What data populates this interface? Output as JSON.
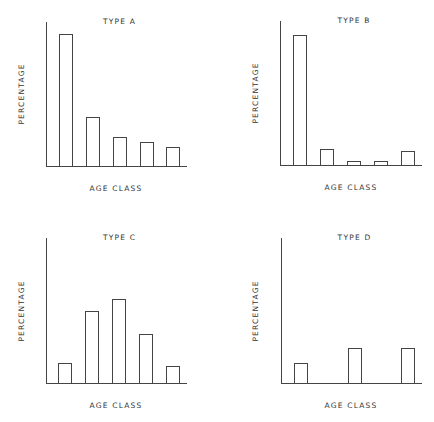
{
  "chart_data": [
    {
      "type": "bar",
      "title": "TYPE A",
      "xlabel": "AGE CLASS",
      "ylabel": "PERCENTAGE",
      "categories": [
        "1",
        "2",
        "3",
        "4",
        "5"
      ],
      "values": [
        92,
        34,
        20,
        17,
        13
      ],
      "ylim": [
        0,
        100
      ],
      "grid": false,
      "tick_labels": false
    },
    {
      "type": "bar",
      "title": "TYPE B",
      "xlabel": "AGE CLASS",
      "ylabel": "PERCENTAGE",
      "categories": [
        "1",
        "2",
        "3",
        "4",
        "5"
      ],
      "values": [
        90,
        11,
        3,
        3,
        10
      ],
      "ylim": [
        0,
        100
      ],
      "grid": false,
      "tick_labels": false
    },
    {
      "type": "bar",
      "title": "TYPE C",
      "xlabel": "AGE CLASS",
      "ylabel": "PERCENTAGE",
      "categories": [
        "1",
        "2",
        "3",
        "4",
        "5"
      ],
      "values": [
        14,
        50,
        58,
        34,
        12
      ],
      "ylim": [
        0,
        100
      ],
      "grid": false,
      "tick_labels": false
    },
    {
      "type": "bar",
      "title": "TYPE D",
      "xlabel": "AGE CLASS",
      "ylabel": "PERCENTAGE",
      "categories": [
        "1",
        "2",
        "3",
        "4",
        "5"
      ],
      "values": [
        14,
        0,
        24,
        0,
        24
      ],
      "ylim": [
        0,
        100
      ],
      "grid": false,
      "tick_labels": false
    }
  ],
  "colors": {
    "line": "#444444",
    "background": "#ffffff",
    "text": "#333333"
  }
}
